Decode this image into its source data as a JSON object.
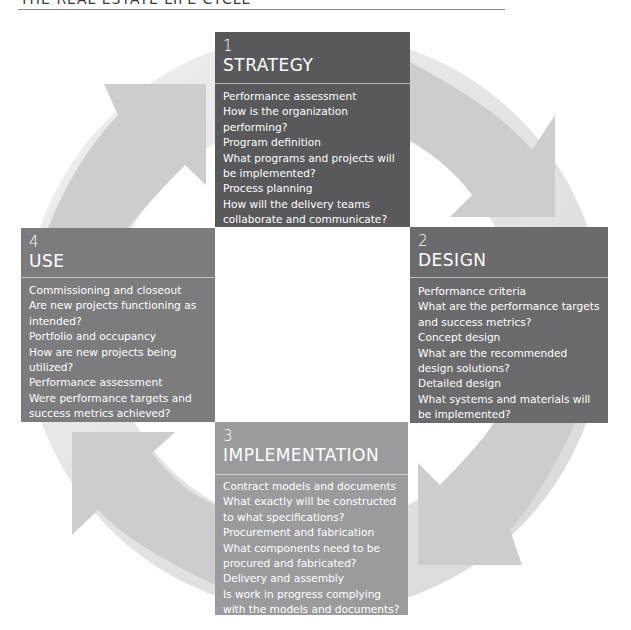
{
  "header": {
    "title": "THE REAL ESTATE LIFE CYCLE"
  },
  "colors": {
    "strategy": "#59595b",
    "design": "#6b6b6d",
    "use": "#7c7c7e",
    "implementation": "#9b9b9d",
    "ring": "#e4e4e4",
    "arrow": "#cfcfcf"
  },
  "phases": {
    "strategy": {
      "number": "1",
      "title": "STRATEGY",
      "items": [
        "Performance assessment",
        "How is the organization performing?",
        "Program definition",
        "What programs and projects will be implemented?",
        "Process planning",
        "How will the delivery teams collaborate and communicate?"
      ]
    },
    "design": {
      "number": "2",
      "title": "DESIGN",
      "items": [
        "Performance criteria",
        "What are the performance targets and success metrics?",
        "Concept design",
        "What are the recommended design solutions?",
        "Detailed design",
        "What systems and materials will be implemented?"
      ]
    },
    "implementation": {
      "number": "3",
      "title": "IMPLEMENTATION",
      "items": [
        "Contract models and documents",
        "What exactly will be constructed to what specifications?",
        "Procurement and fabrication",
        "What components need to be procured and fabricated?",
        "Delivery and assembly",
        "Is work in progress complying with the models and documents?"
      ]
    },
    "use": {
      "number": "4",
      "title": "USE",
      "items": [
        "Commissioning and closeout",
        "Are new projects functioning as intended?",
        "Portfolio and occupancy",
        "How are new projects being utilized?",
        "Performance assessment",
        "Were performance targets and success metrics achieved?"
      ]
    }
  }
}
